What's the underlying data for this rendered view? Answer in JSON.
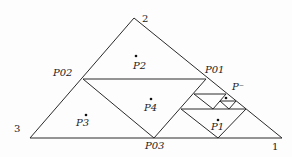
{
  "diagram": {
    "vertex_labels": {
      "top": "2",
      "left": "3",
      "right": "1"
    },
    "point_labels": {
      "p01": "P01",
      "p02": "P02",
      "p03": "P03",
      "p_minus": "P⁻",
      "p1": "P1",
      "p2": "P2",
      "p3": "P3",
      "p4": "P4"
    }
  }
}
